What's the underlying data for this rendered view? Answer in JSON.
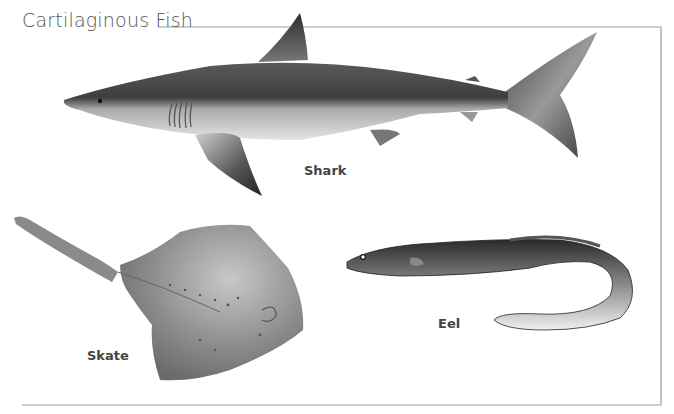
{
  "title": "Cartilaginous Fish",
  "labels": {
    "shark": "Shark",
    "skate": "Skate",
    "eel": "Eel"
  },
  "colors": {
    "frame": "#9a9a9a",
    "title": "#555555",
    "label": "#444444",
    "shark_dark": "#4a4a4a",
    "shark_light": "#d9d9d9",
    "skate": "#8f8f8f",
    "eel_dark": "#3a3a3a"
  }
}
